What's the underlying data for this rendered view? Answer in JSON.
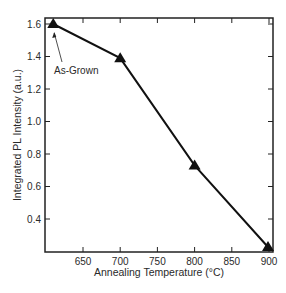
{
  "chart_data": {
    "type": "line",
    "title": "",
    "xlabel": "Annealing Temperature (°C)",
    "ylabel": "Integrated PL Intensity (a.u.)",
    "xlim": [
      605,
      905
    ],
    "ylim": [
      0.2,
      1.65
    ],
    "x_ticks": [
      650,
      700,
      750,
      800,
      850,
      900
    ],
    "y_ticks": [
      0.4,
      0.6,
      0.8,
      1.0,
      1.2,
      1.4,
      1.6
    ],
    "x_tick_labels": [
      "650",
      "700",
      "750",
      "800",
      "850",
      "900"
    ],
    "y_tick_labels": [
      "0.4",
      "0.6",
      "0.8",
      "1.0",
      "1.2",
      "1.4",
      "1.6"
    ],
    "grid": false,
    "legend": null,
    "series": [
      {
        "name": "Integrated PL Intensity",
        "marker": "triangle",
        "color": "#111111",
        "x": [
          610,
          700,
          800,
          900
        ],
        "y": [
          1.6,
          1.39,
          0.73,
          0.2
        ]
      }
    ],
    "annotations": [
      {
        "text": "As-Grown",
        "points_to": {
          "x": 610,
          "y": 1.6
        }
      }
    ]
  }
}
